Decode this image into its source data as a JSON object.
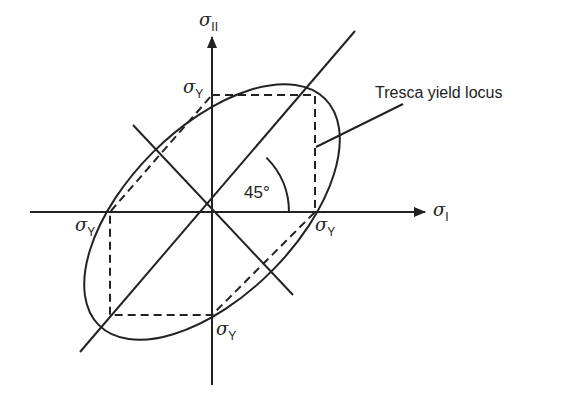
{
  "axes": {
    "x": {
      "symbol": "σ",
      "subscript": "I"
    },
    "y": {
      "symbol": "σ",
      "subscript": "II"
    }
  },
  "yield_labels": {
    "symbol": "σ",
    "subscript": "Y",
    "positions": [
      "top",
      "left",
      "right",
      "bottom"
    ]
  },
  "annotations": {
    "locus_label": "Tresca yield locus",
    "angle_label": "45°"
  },
  "colors": {
    "line": "#222222",
    "background": "#ffffff"
  },
  "geometry": {
    "origin": [
      212,
      212
    ],
    "sigma_Y_px": 103,
    "hexagon": [
      [
        212,
        95
      ],
      [
        315,
        95
      ],
      [
        315,
        212
      ],
      [
        212,
        315
      ],
      [
        110,
        315
      ],
      [
        110,
        212
      ]
    ],
    "ellipse": {
      "rx": 160,
      "ry": 84,
      "rotation_deg": -45
    }
  }
}
